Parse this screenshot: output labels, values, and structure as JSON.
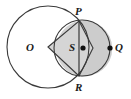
{
  "figure": {
    "background_color": "#ffffff",
    "stroke_color": "#333333",
    "fill_color": "#d5d5d5",
    "lens_fill_color": "#c9c9c9",
    "dot_color": "#111111",
    "labels": {
      "center_large": "O",
      "top_intersection": "P",
      "right_extreme": "Q",
      "bottom_intersection": "R",
      "center_small": "S"
    },
    "points": [
      {
        "name": "O",
        "label": "O",
        "x": 48,
        "y": 47,
        "has_dot": false
      },
      {
        "name": "P",
        "label": "P",
        "x": 79,
        "y": 21,
        "has_dot": false
      },
      {
        "name": "S",
        "label": "S",
        "x": 83,
        "y": 48,
        "has_dot": true
      },
      {
        "name": "Q",
        "label": "Q",
        "x": 110,
        "y": 48,
        "has_dot": true
      },
      {
        "name": "R",
        "label": "R",
        "x": 79,
        "y": 76,
        "has_dot": false
      }
    ],
    "shapes": [
      {
        "name": "large-circle",
        "type": "circle",
        "cx": 48,
        "cy": 47,
        "r": 41
      },
      {
        "name": "small-circle",
        "type": "circle",
        "cx": 82,
        "cy": 48,
        "r": 28
      },
      {
        "name": "kite",
        "type": "polygon",
        "vertices": "48,47 79,21 93,48 79,76"
      },
      {
        "name": "chord-PR",
        "type": "line",
        "x1": 79,
        "y1": 21,
        "x2": 79,
        "y2": 76
      }
    ]
  }
}
